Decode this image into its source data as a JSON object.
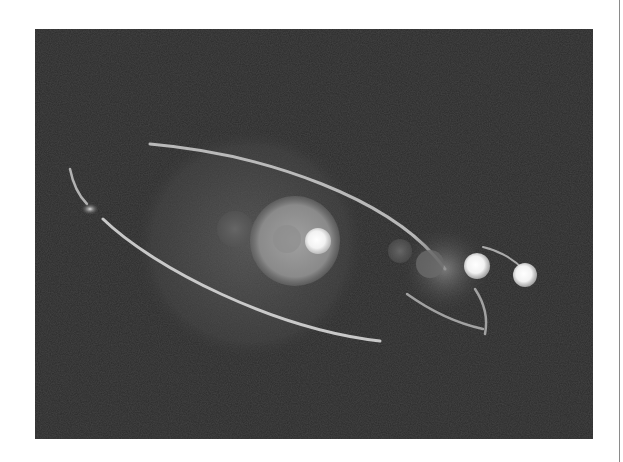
{
  "image": {
    "subject": "Orbital illustration: glowing central sphere with elliptical orbit rings and bright satellite bodies against a dark textured background",
    "palette": {
      "background": "#2b2b2b",
      "page": "#ffffff",
      "orbit": "#d8d8d8",
      "glow_core": "#ffffff",
      "halo": "#6a6a6a",
      "edge_rule": "#8a8a8a"
    },
    "bodies": [
      {
        "name": "central-star",
        "brightness": "high"
      },
      {
        "name": "inner-faint-planet",
        "brightness": "low"
      },
      {
        "name": "small-dim-planet",
        "brightness": "low"
      },
      {
        "name": "bright-satellite-1",
        "brightness": "high"
      },
      {
        "name": "bright-satellite-2",
        "brightness": "high"
      },
      {
        "name": "left-orbit-node",
        "brightness": "medium"
      }
    ]
  }
}
